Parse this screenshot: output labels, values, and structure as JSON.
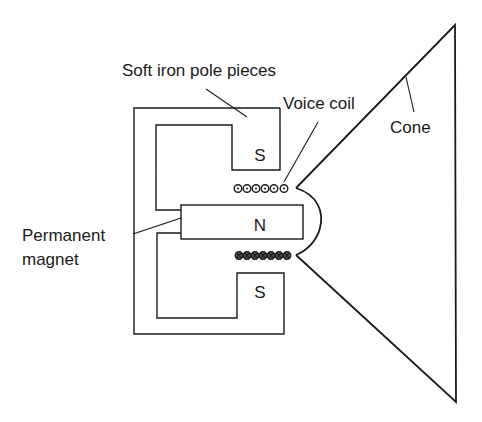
{
  "labels": {
    "pole_pieces": "Soft iron pole pieces",
    "voice_coil": "Voice coil",
    "cone": "Cone",
    "magnet_line1": "Permanent",
    "magnet_line2": "magnet"
  },
  "poles": {
    "top": "S",
    "center": "N",
    "bottom": "S"
  },
  "coil": {
    "top_turns": 6,
    "top_symbol": "dot (current out of page)",
    "bottom_turns": 7,
    "bottom_symbol": "cross (current into page)"
  },
  "colors": {
    "line": "#1a1a1a",
    "background": "#ffffff"
  }
}
